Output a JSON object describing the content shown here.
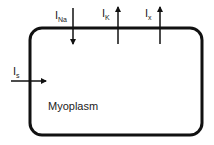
{
  "diagram": {
    "compartment": {
      "label": "Myoplasm",
      "stroke_color": "#111111"
    },
    "currents": [
      {
        "id": "INa",
        "base": "I",
        "subscript": "Na",
        "direction": "inward"
      },
      {
        "id": "IK",
        "base": "I",
        "subscript": "K",
        "direction": "outward"
      },
      {
        "id": "Ix",
        "base": "I",
        "subscript": "x",
        "direction": "outward"
      },
      {
        "id": "Is",
        "base": "I",
        "subscript": "s",
        "direction": "inward"
      }
    ]
  }
}
